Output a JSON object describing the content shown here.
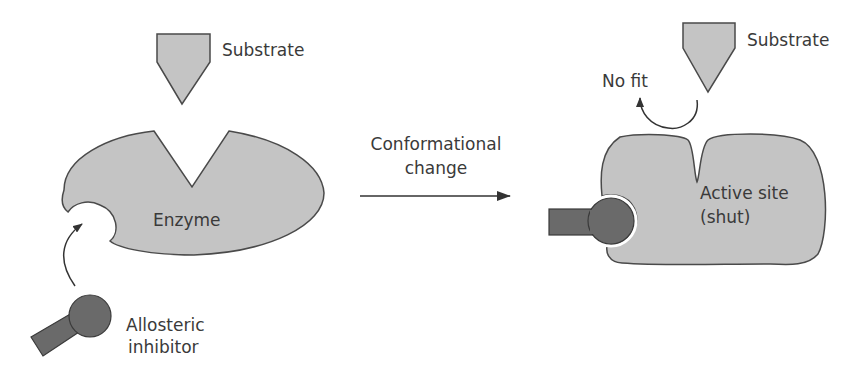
{
  "diagram": {
    "colors": {
      "shape_fill": "#c4c4c4",
      "outline": "#4a4a4a",
      "inhibitor_fill": "#6a6a6a",
      "text": "#3a3a3a",
      "arrow": "#333333"
    },
    "left_panel": {
      "substrate_label": "Substrate",
      "enzyme_label": "Enzyme",
      "inhibitor_label_line1": "Allosteric",
      "inhibitor_label_line2": "inhibitor"
    },
    "transition": {
      "label_line1": "Conformational",
      "label_line2": "change"
    },
    "right_panel": {
      "substrate_label": "Substrate",
      "no_fit_label": "No fit",
      "active_site_label_line1": "Active site",
      "active_site_label_line2": "(shut)"
    }
  }
}
